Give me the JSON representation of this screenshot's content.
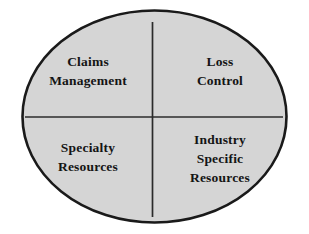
{
  "diagram": {
    "type": "quadrant-ellipse",
    "shape": "ellipse",
    "fill_color": "#d5d5d5",
    "border_color": "#1a1a1a",
    "divider_color": "#2b2b2b",
    "background_color": "#ffffff",
    "text_color": "#141414",
    "quadrants": [
      {
        "position": "top-left",
        "lines": [
          "Claims",
          "Management"
        ],
        "line1": "Claims",
        "line2": "Management"
      },
      {
        "position": "top-right",
        "lines": [
          "Loss",
          "Control"
        ],
        "line1": "Loss",
        "line2": "Control"
      },
      {
        "position": "bottom-left",
        "lines": [
          "Specialty",
          "Resources"
        ],
        "line1": "Specialty",
        "line2": "Resources"
      },
      {
        "position": "bottom-right",
        "lines": [
          "Industry",
          "Specific",
          "Resources"
        ],
        "line1": "Industry",
        "line2": "Specific",
        "line3": "Resources"
      }
    ]
  }
}
